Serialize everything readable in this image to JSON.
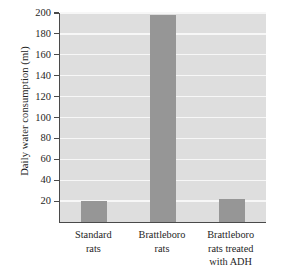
{
  "chart_data": {
    "type": "bar",
    "title": "",
    "xlabel": "",
    "ylabel": "Daily water consumption (ml)",
    "categories": [
      "Standard rats",
      "Brattleboro rats",
      "Brattleboro rats treated with ADH"
    ],
    "category_lines": [
      [
        "Standard",
        "rats"
      ],
      [
        "Brattleboro",
        "rats"
      ],
      [
        "Brattleboro",
        "rats treated",
        "with ADH"
      ]
    ],
    "values": [
      20,
      198,
      22
    ],
    "ylim": [
      0,
      200
    ],
    "yticks": [
      200,
      180,
      160,
      140,
      120,
      100,
      80,
      60,
      40,
      20
    ],
    "ytick_labels": [
      "200",
      "180",
      "160",
      "140",
      "120",
      "100",
      "80",
      "60",
      "40",
      "20"
    ],
    "grid": true,
    "legend": "none",
    "colors": {
      "bar": "#969696",
      "plot_background": "#dedede",
      "gridline": "#f7f7f7",
      "axis": "#4a4a4a",
      "text": "#262626",
      "figure_background": "#ffffff"
    }
  }
}
